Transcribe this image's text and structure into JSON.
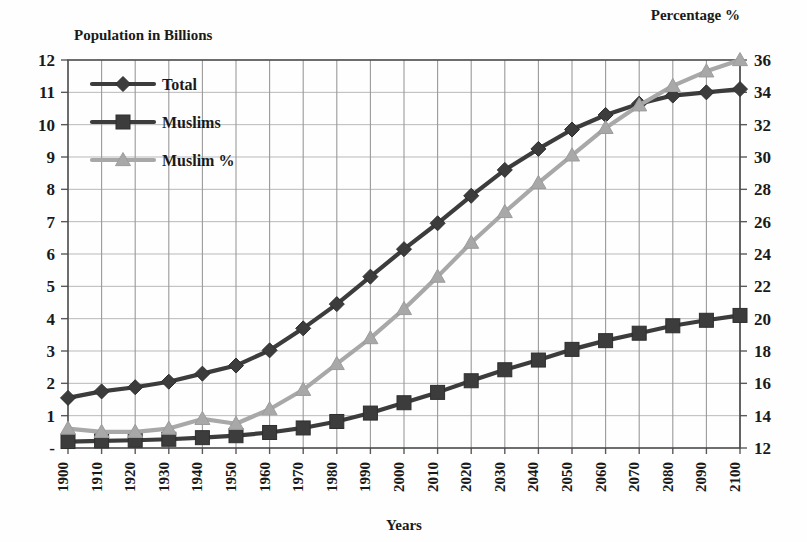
{
  "chart_data": {
    "type": "line",
    "title": "",
    "xlabel": "Years",
    "ylabel": "Population in Billions",
    "ylabel_right": "Percentage %",
    "grid": true,
    "legend_position": "top-left",
    "x": [
      1900,
      1910,
      1920,
      1930,
      1940,
      1950,
      1960,
      1970,
      1980,
      1990,
      2000,
      2010,
      2020,
      2030,
      2040,
      2050,
      2060,
      2070,
      2080,
      2090,
      2100
    ],
    "xtick_labels": [
      "1900",
      "1910",
      "1920",
      "1930",
      "1940",
      "1950",
      "1960",
      "1970",
      "1980",
      "1990",
      "2000",
      "2010",
      "2020",
      "2030",
      "2040",
      "2050",
      "2060",
      "2070",
      "2080",
      "2090",
      "2100"
    ],
    "ylim": [
      0,
      12
    ],
    "ytick_labels": [
      "-",
      "1",
      "2",
      "3",
      "4",
      "5",
      "6",
      "7",
      "8",
      "9",
      "10",
      "11",
      "12"
    ],
    "ytick_values": [
      0,
      1,
      2,
      3,
      4,
      5,
      6,
      7,
      8,
      9,
      10,
      11,
      12
    ],
    "ylim_right": [
      12,
      36
    ],
    "ytick_labels_right": [
      "12",
      "14",
      "16",
      "18",
      "20",
      "22",
      "24",
      "26",
      "28",
      "30",
      "32",
      "34",
      "36"
    ],
    "ytick_values_right": [
      12,
      14,
      16,
      18,
      20,
      22,
      24,
      26,
      28,
      30,
      32,
      34,
      36
    ],
    "series": [
      {
        "name": "Total",
        "axis": "left",
        "marker": "diamond",
        "color": "#3c3c3c",
        "values": [
          1.55,
          1.75,
          1.88,
          2.05,
          2.3,
          2.55,
          3.02,
          3.7,
          4.45,
          5.3,
          6.15,
          6.95,
          7.8,
          8.6,
          9.25,
          9.85,
          10.3,
          10.65,
          10.9,
          11.0,
          11.1
        ]
      },
      {
        "name": "Muslims",
        "axis": "left",
        "marker": "square",
        "color": "#3c3c3c",
        "values": [
          0.2,
          0.22,
          0.24,
          0.27,
          0.32,
          0.38,
          0.48,
          0.62,
          0.82,
          1.08,
          1.4,
          1.72,
          2.08,
          2.42,
          2.72,
          3.05,
          3.32,
          3.55,
          3.78,
          3.95,
          4.1
        ]
      },
      {
        "name": "Muslim %",
        "axis": "right",
        "marker": "triangle",
        "color": "#a8a8a8",
        "values": [
          13.2,
          13.0,
          13.0,
          13.2,
          13.8,
          13.5,
          14.4,
          15.6,
          17.2,
          18.8,
          20.6,
          22.6,
          24.7,
          26.6,
          28.4,
          30.1,
          31.8,
          33.2,
          34.4,
          35.3,
          36.0
        ]
      }
    ]
  },
  "legend": {
    "items": [
      {
        "label": "Total"
      },
      {
        "label": "Muslims"
      },
      {
        "label": "Muslim %"
      }
    ]
  }
}
